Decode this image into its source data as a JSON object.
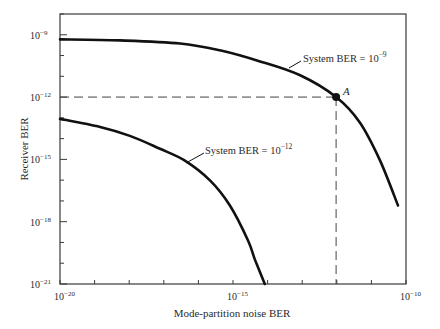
{
  "chart_data": {
    "type": "line",
    "title": "",
    "xlabel": "Mode-partition noise BER",
    "ylabel": "Receiver BER",
    "xscale": "log",
    "yscale": "log",
    "xlim": [
      1e-20,
      1e-10
    ],
    "ylim": [
      1e-21,
      1e-08
    ],
    "x_ticks": [
      {
        "exp": -20,
        "label": "10",
        "sup": "−20"
      },
      {
        "exp": -15,
        "label": "10",
        "sup": "−15"
      },
      {
        "exp": -10,
        "label": "10",
        "sup": "−10"
      }
    ],
    "y_ticks": [
      {
        "exp": -9,
        "label": "10",
        "sup": "−9"
      },
      {
        "exp": -12,
        "label": "10",
        "sup": "−12"
      },
      {
        "exp": -15,
        "label": "10",
        "sup": "−15"
      },
      {
        "exp": -18,
        "label": "10",
        "sup": "−18"
      },
      {
        "exp": -21,
        "label": "10",
        "sup": "−21"
      }
    ],
    "grid": false,
    "series": [
      {
        "name": "System BER = 10^-9",
        "label_text": "System BER = 10",
        "label_sup": "−9",
        "log10_x": [
          -20.0,
          -18.27,
          -16.53,
          -15.38,
          -14.22,
          -13.06,
          -12.02,
          -11.33,
          -10.75,
          -10.23
        ],
        "log10_y": [
          -9.22,
          -9.27,
          -9.42,
          -9.75,
          -10.28,
          -10.95,
          -12.0,
          -13.24,
          -15.06,
          -17.22
        ]
      },
      {
        "name": "System BER = 10^-12",
        "label_text": "System BER = 10",
        "label_sup": "−12",
        "log10_x": [
          -20.0,
          -18.84,
          -17.98,
          -17.11,
          -16.39,
          -15.66,
          -15.09,
          -14.57,
          -14.36,
          -14.08
        ],
        "log10_y": [
          -13.05,
          -13.44,
          -13.87,
          -14.49,
          -15.06,
          -16.02,
          -17.22,
          -18.89,
          -19.85,
          -21.0
        ]
      }
    ],
    "annotations": [
      {
        "type": "point",
        "label": "A",
        "log10_x": -12.02,
        "log10_y": -12.0
      },
      {
        "type": "dashed-guide",
        "from": "A",
        "to": "x-axis and y-axis"
      }
    ]
  }
}
